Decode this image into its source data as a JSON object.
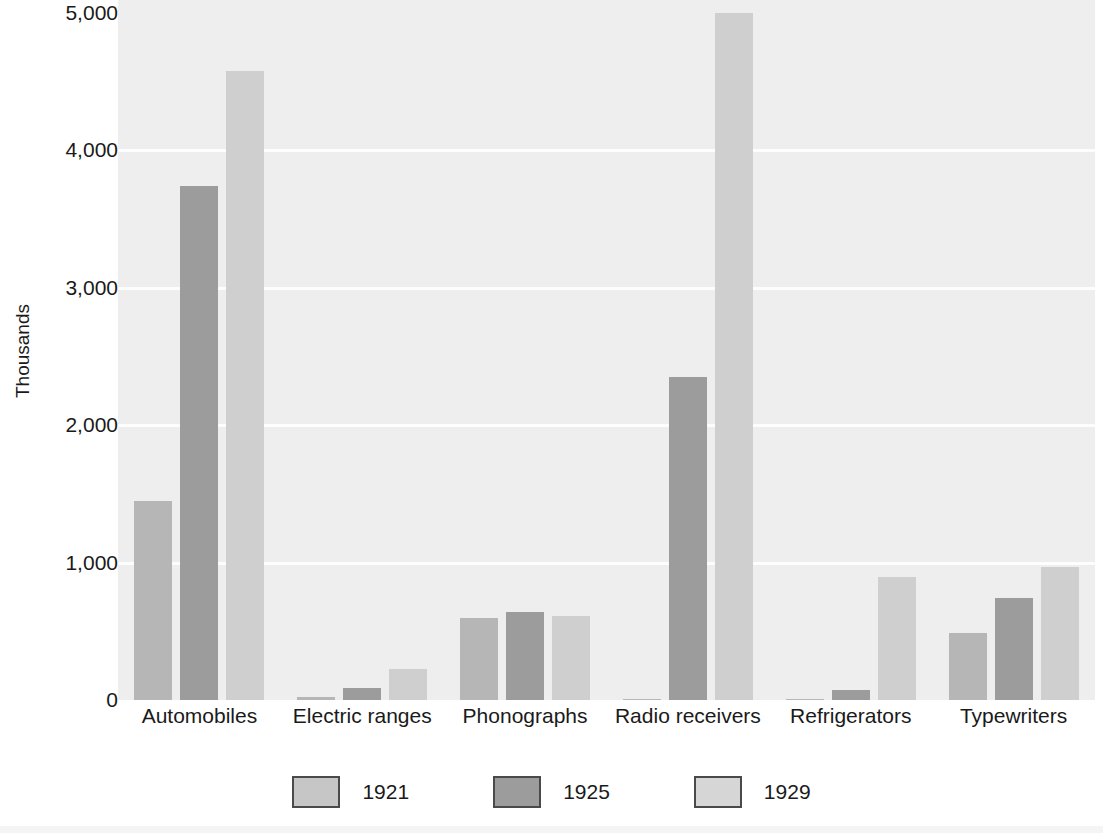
{
  "chart_data": {
    "type": "bar",
    "title": "",
    "xlabel": "",
    "ylabel": "Thousands",
    "ylim": [
      0,
      5000
    ],
    "yticks": [
      "0",
      "1,000",
      "2,000",
      "3,000",
      "4,000",
      "5,000"
    ],
    "ytick_values": [
      0,
      1000,
      2000,
      3000,
      4000,
      5000
    ],
    "grid": true,
    "legend_position": "bottom",
    "categories": [
      "Automobiles",
      "Electric ranges",
      "Phonographs",
      "Radio receivers",
      "Refrigerators",
      "Typewriters"
    ],
    "series": [
      {
        "name": "1921",
        "color": "#b6b6b6",
        "values": [
          1450,
          25,
          595,
          5,
          8,
          490
        ]
      },
      {
        "name": "1925",
        "color": "#9c9c9c",
        "values": [
          3740,
          90,
          640,
          2350,
          75,
          740
        ]
      },
      {
        "name": "1929",
        "color": "#cfcfcf",
        "values": [
          4580,
          225,
          610,
          5000,
          895,
          970
        ]
      }
    ]
  },
  "legend": {
    "entries": [
      {
        "label": "1921",
        "swatch": "#c6c6c6"
      },
      {
        "label": "1925",
        "swatch": "#9c9c9c"
      },
      {
        "label": "1929",
        "swatch": "#d6d6d6"
      }
    ]
  },
  "background_text": {
    "paragraph": [
      "showed the greatest percentage gains. Between 1921 and",
      "1929 the production of automobiles rose from 1,468,000 to",
      "4,587,000 and that of radios from 5,000 to 4,428,000 units.",
      "Sales of refrigerators climbed from 5,000 to 890,000, and the",
      "output of electric ranges, washing machines, and vacuum",
      "cleaners also rose sharply. Mass production techniques",
      "made these durable goods available to a far wider market."
    ],
    "heading": "Consumer Durable Goods Production",
    "small_line_1": "FIGURE",
    "small_line_2": "3.4"
  }
}
